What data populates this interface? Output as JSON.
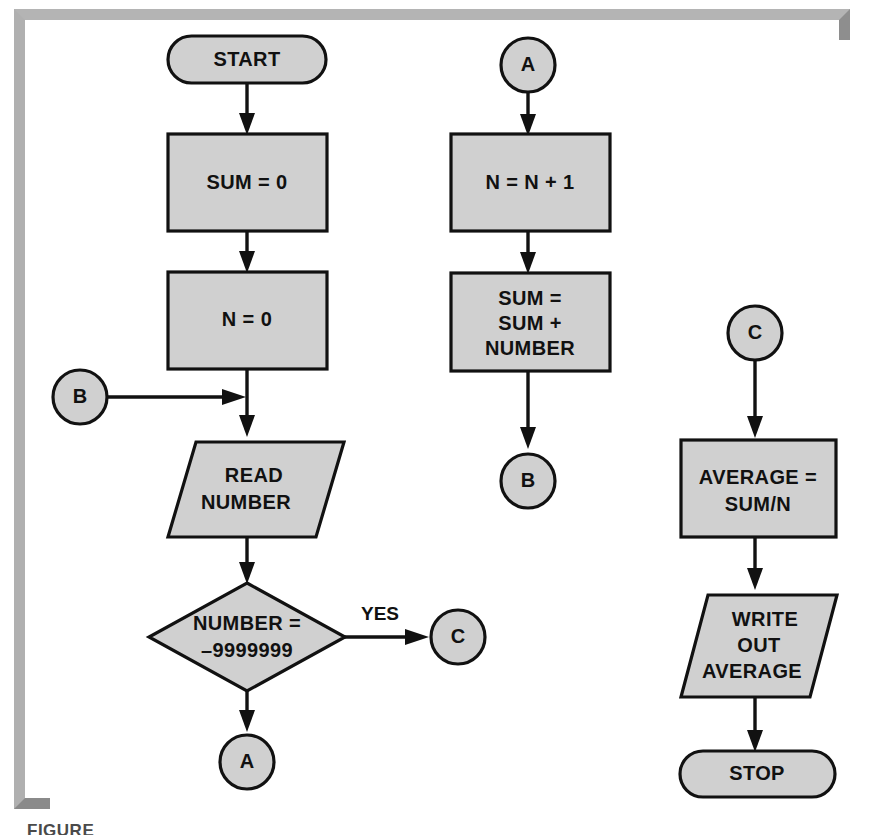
{
  "figure": {
    "caption": "FIGURE",
    "background_color": "#ffffff",
    "frame_color": "#b4b4b4",
    "shape_fill": "#d0d0d0",
    "stroke_color": "#111111"
  },
  "flowchart": {
    "title": "Average of numbers flowchart",
    "columns": [
      {
        "name": "left-column",
        "nodes": [
          {
            "id": "start",
            "type": "terminal",
            "label": "START"
          },
          {
            "id": "sum-init",
            "type": "process",
            "label": "SUM = 0"
          },
          {
            "id": "n-init",
            "type": "process",
            "label": "N = 0"
          },
          {
            "id": "read",
            "type": "io",
            "label_line1": "READ",
            "label_line2": "NUMBER"
          },
          {
            "id": "test",
            "type": "decision",
            "label_line1": "NUMBER =",
            "label_line2": "–9999999"
          }
        ],
        "connectors": [
          {
            "id": "conn-b-in",
            "type": "connector",
            "label": "B"
          },
          {
            "id": "conn-c-out",
            "type": "connector",
            "label": "C"
          },
          {
            "id": "conn-a-out",
            "type": "connector",
            "label": "A"
          }
        ],
        "edge_labels": [
          {
            "id": "yes-label",
            "text": "YES"
          }
        ]
      },
      {
        "name": "middle-column",
        "nodes": [
          {
            "id": "n-incr",
            "type": "process",
            "label": "N = N + 1"
          },
          {
            "id": "sum-acc",
            "type": "process",
            "label_line1": "SUM =",
            "label_line2": "SUM +",
            "label_line3": "NUMBER"
          }
        ],
        "connectors": [
          {
            "id": "conn-a-in",
            "type": "connector",
            "label": "A"
          },
          {
            "id": "conn-b-out",
            "type": "connector",
            "label": "B"
          }
        ]
      },
      {
        "name": "right-column",
        "nodes": [
          {
            "id": "average",
            "type": "process",
            "label_line1": "AVERAGE  =",
            "label_line2": "SUM/N"
          },
          {
            "id": "write",
            "type": "io",
            "label_line1": "WRITE",
            "label_line2": "OUT",
            "label_line3": "AVERAGE"
          },
          {
            "id": "stop",
            "type": "terminal",
            "label": "STOP"
          }
        ],
        "connectors": [
          {
            "id": "conn-c-in",
            "type": "connector",
            "label": "C"
          }
        ]
      }
    ]
  }
}
